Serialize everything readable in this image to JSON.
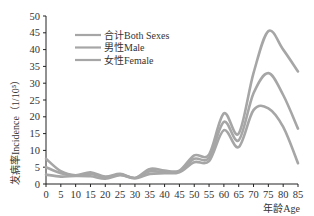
{
  "chart_data": {
    "type": "line",
    "title": "",
    "xlabel": "年龄Age",
    "ylabel": "发病率Incidence（1/10⁵）",
    "x": [
      0,
      5,
      10,
      15,
      20,
      25,
      30,
      35,
      40,
      45,
      50,
      55,
      60,
      65,
      70,
      75,
      80,
      85
    ],
    "xticks": [
      "0",
      "5",
      "10",
      "15",
      "20",
      "25",
      "30",
      "35",
      "40",
      "45",
      "50",
      "55",
      "60",
      "65",
      "70",
      "75",
      "80",
      "85"
    ],
    "yticks": [
      "0",
      "5",
      "10",
      "15",
      "20",
      "25",
      "30",
      "35",
      "40",
      "45",
      "50"
    ],
    "xlim": [
      0,
      85
    ],
    "ylim": [
      0,
      50
    ],
    "grid": false,
    "legend_position": "upper-left-inside",
    "line_color": "#a6a6a6",
    "series": [
      {
        "name": "合计Both Sexes",
        "values": [
          5.0,
          3.2,
          2.5,
          3.0,
          2.0,
          2.8,
          1.8,
          3.8,
          3.5,
          3.8,
          7.5,
          7.8,
          18.5,
          13.0,
          27.0,
          33.0,
          26.5,
          16.5
        ]
      },
      {
        "name": "男性Male",
        "values": [
          7.5,
          3.8,
          2.6,
          3.5,
          2.2,
          3.0,
          1.8,
          4.5,
          4.0,
          4.0,
          8.5,
          8.8,
          21.0,
          15.0,
          33.0,
          45.5,
          40.0,
          33.5
        ]
      },
      {
        "name": "女性Female",
        "values": [
          2.8,
          2.2,
          2.4,
          2.3,
          1.6,
          2.6,
          1.7,
          3.0,
          3.2,
          3.5,
          6.5,
          6.8,
          16.0,
          11.0,
          22.0,
          22.5,
          17.0,
          6.2
        ]
      }
    ]
  }
}
